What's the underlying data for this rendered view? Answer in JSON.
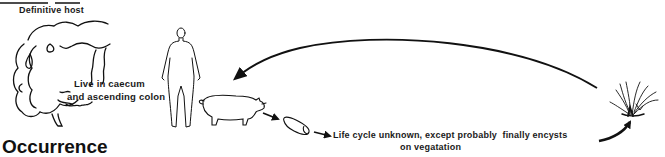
{
  "diagram": {
    "type": "parasite life cycle",
    "header_label": "Definitive host",
    "section_title": "Occurrence",
    "annotations": {
      "habitat_line1": "Live in caecum",
      "habitat_line2": "and ascending colon",
      "life_cycle_line1": "Life cycle unknown, except probably  finally encysts",
      "life_cycle_line2": "on vegatation"
    },
    "nodes": [
      {
        "id": "intestine",
        "icon": "large-intestine-icon"
      },
      {
        "id": "human",
        "icon": "human-figure-icon"
      },
      {
        "id": "pig",
        "icon": "pig-icon"
      },
      {
        "id": "cyst",
        "icon": "cyst-icon"
      },
      {
        "id": "vegetation",
        "icon": "grass-plant-icon"
      }
    ],
    "edges": [
      {
        "from": "vegetation",
        "to": "pig",
        "style": "long curved arrow"
      },
      {
        "from": "pig",
        "to": "cyst",
        "style": "short arrow"
      },
      {
        "from": "cyst",
        "to": "life_cycle_text",
        "style": "short arrow"
      },
      {
        "from": "life_cycle_text",
        "to": "vegetation",
        "style": "curved arrow"
      }
    ]
  }
}
